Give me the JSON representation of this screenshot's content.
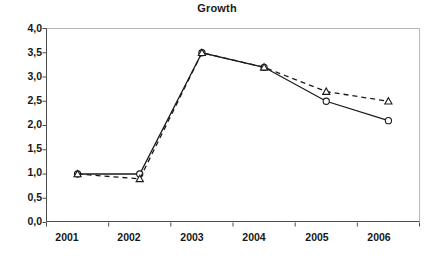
{
  "chart_data": {
    "type": "line",
    "title": "Growth",
    "xlabel": "",
    "ylabel": "",
    "categories": [
      "2001",
      "2002",
      "2003",
      "2004",
      "2005",
      "2006"
    ],
    "series": [
      {
        "name": "series-solid-circle",
        "marker": "circle",
        "linestyle": "solid",
        "color": "#1a1a1a",
        "values": [
          1.0,
          1.0,
          3.5,
          3.2,
          2.5,
          2.1
        ]
      },
      {
        "name": "series-dashed-triangle",
        "marker": "triangle",
        "linestyle": "dashed",
        "color": "#1a1a1a",
        "values": [
          1.0,
          0.9,
          3.5,
          3.2,
          2.7,
          2.5
        ]
      }
    ],
    "ylim": [
      0.0,
      4.0
    ],
    "ytick_values": [
      0.0,
      0.5,
      1.0,
      1.5,
      2.0,
      2.5,
      3.0,
      3.5,
      4.0
    ],
    "ytick_labels": [
      "0,0",
      "0,5",
      "1,0",
      "1,5",
      "2,0",
      "2,5",
      "3,0",
      "3,5",
      "4,0"
    ],
    "xtick_labels": [
      "2001",
      "2002",
      "2003",
      "2004",
      "2005",
      "2006"
    ],
    "grid": false,
    "legend": "none",
    "decimal_separator": ","
  }
}
